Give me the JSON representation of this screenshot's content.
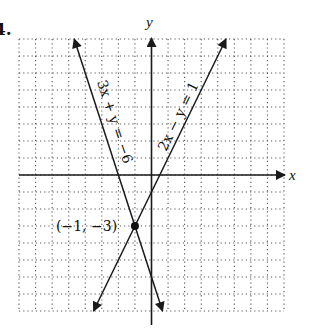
{
  "problem": {
    "number_label": "4."
  },
  "colors": {
    "axis": "#1a1a1a",
    "line": "#1a1a1a",
    "grid": "#555555",
    "point": "#111111",
    "background": "#ffffff"
  },
  "chart_data": {
    "type": "line",
    "title": "",
    "xlabel": "x",
    "ylabel": "y",
    "xlim": [
      -8,
      8
    ],
    "ylim": [
      -8,
      8
    ],
    "grid": true,
    "grid_style": "dotted",
    "tick_step": 1,
    "series": [
      {
        "name": "3x + y = −6",
        "equation": "y = -3x - 6",
        "slope": -3,
        "intercept": -6,
        "endpoints": [
          [
            -4.667,
            8
          ],
          [
            0.667,
            -8
          ]
        ],
        "arrows": "both"
      },
      {
        "name": "2x − y = 1",
        "equation": "y = 2x - 1",
        "slope": 2,
        "intercept": -1,
        "endpoints": [
          [
            -3.5,
            -8
          ],
          [
            4.5,
            8
          ]
        ],
        "arrows": "both"
      }
    ],
    "annotations": [
      {
        "type": "point",
        "x": -1,
        "y": -3,
        "label": "(−1, −3)"
      }
    ]
  },
  "labels": {
    "x_axis": "x",
    "y_axis": "y",
    "line1": "3x + y = −6",
    "line2": "2x − y = 1",
    "intersection": "(−1, −3)"
  }
}
